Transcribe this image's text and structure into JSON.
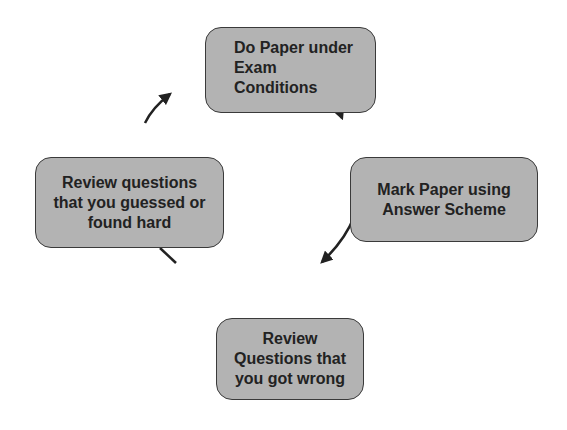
{
  "diagram": {
    "type": "cycle",
    "nodes": [
      {
        "id": "n1",
        "label": "Do Paper under\n  Exam\nConditions"
      },
      {
        "id": "n2",
        "label": "Mark Paper using\nAnswer Scheme"
      },
      {
        "id": "n4",
        "label": "Review\nQuestions that\nyou got wrong"
      },
      {
        "id": "n3",
        "label": "Review questions\nthat you guessed or\nfound hard"
      }
    ],
    "edges": [
      {
        "from": "n1",
        "to": "n2"
      },
      {
        "from": "n2",
        "to": "n4"
      },
      {
        "from": "n4",
        "to": "n3"
      },
      {
        "from": "n3",
        "to": "n1"
      }
    ],
    "colors": {
      "node_fill": "#b3b3b3",
      "node_border": "#3a3a3a",
      "text": "#222222",
      "arrow": "#222222"
    }
  }
}
